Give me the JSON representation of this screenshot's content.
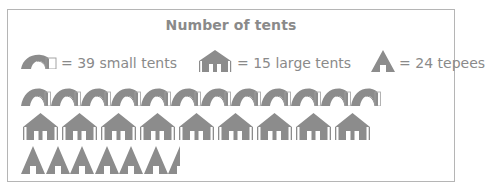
{
  "chart_data": {
    "type": "pictograph",
    "title": "Number of tents",
    "colors": {
      "icon": "#8c8c8c",
      "text": "#8a8a8a",
      "border": "#b5b5b5"
    },
    "legend": [
      {
        "icon": "small-tent-icon",
        "label": "= 39 small tents",
        "per_icon": 39,
        "unit": "small tents"
      },
      {
        "icon": "large-tent-icon",
        "label": "= 15 large tents",
        "per_icon": 15,
        "unit": "large tents"
      },
      {
        "icon": "tepee-icon",
        "label": "= 24 tepees",
        "per_icon": 24,
        "unit": "tepees"
      }
    ],
    "categories": [
      "small tents",
      "large tents",
      "tepees"
    ],
    "series": [
      {
        "name": "small tents",
        "icons": 12,
        "value": 468
      },
      {
        "name": "large tents",
        "icons": 9,
        "value": 135
      },
      {
        "name": "tepees",
        "icons": 6.5,
        "value": 156
      }
    ]
  }
}
